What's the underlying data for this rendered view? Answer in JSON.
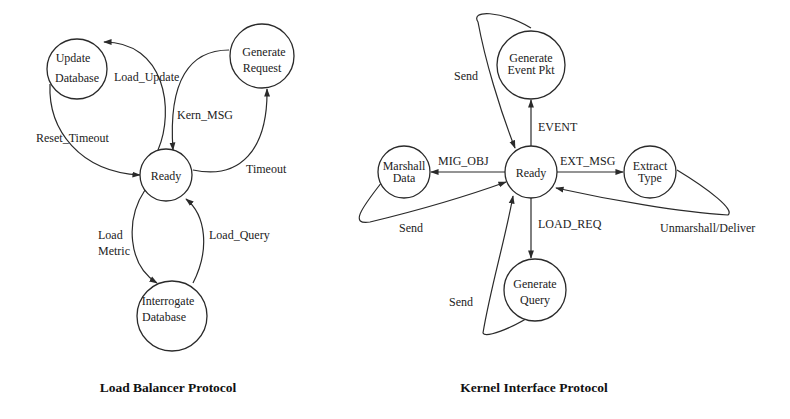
{
  "colors": {
    "stroke": "#2a2a2a",
    "text": "#222222",
    "background": "#ffffff"
  },
  "load_balancer": {
    "title": "Load Balancer Protocol",
    "nodes": {
      "update_database": {
        "line1": "Update",
        "line2": "Database"
      },
      "generate_request": {
        "line1": "Generate",
        "line2": "Request"
      },
      "ready": {
        "label": "Ready"
      },
      "interrogate_database": {
        "line1": "Interrogate",
        "line2": "Database"
      }
    },
    "edges": {
      "load_update": "Load_Update",
      "reset_timeout": "Reset_Timeout",
      "kern_msg": "Kern_MSG",
      "timeout": "Timeout",
      "load_metric_1": "Load",
      "load_metric_2": "Metric",
      "load_query": "Load_Query"
    }
  },
  "kernel_interface": {
    "title": "Kernel Interface Protocol",
    "nodes": {
      "ready": {
        "label": "Ready"
      },
      "generate_event_pkt": {
        "line1": "Generate",
        "line2": "Event Pkt"
      },
      "marshall_data": {
        "line1": "Marshall",
        "line2": "Data"
      },
      "extract_type": {
        "line1": "Extract",
        "line2": "Type"
      },
      "generate_query": {
        "line1": "Generate",
        "line2": "Query"
      }
    },
    "edges": {
      "event": "EVENT",
      "mig_obj": "MIG_OBJ",
      "ext_msg": "EXT_MSG",
      "load_req": "LOAD_REQ",
      "send_event": "Send",
      "send_marshall": "Send",
      "send_query": "Send",
      "unmarshall_deliver": "Unmarshall/Deliver"
    }
  }
}
